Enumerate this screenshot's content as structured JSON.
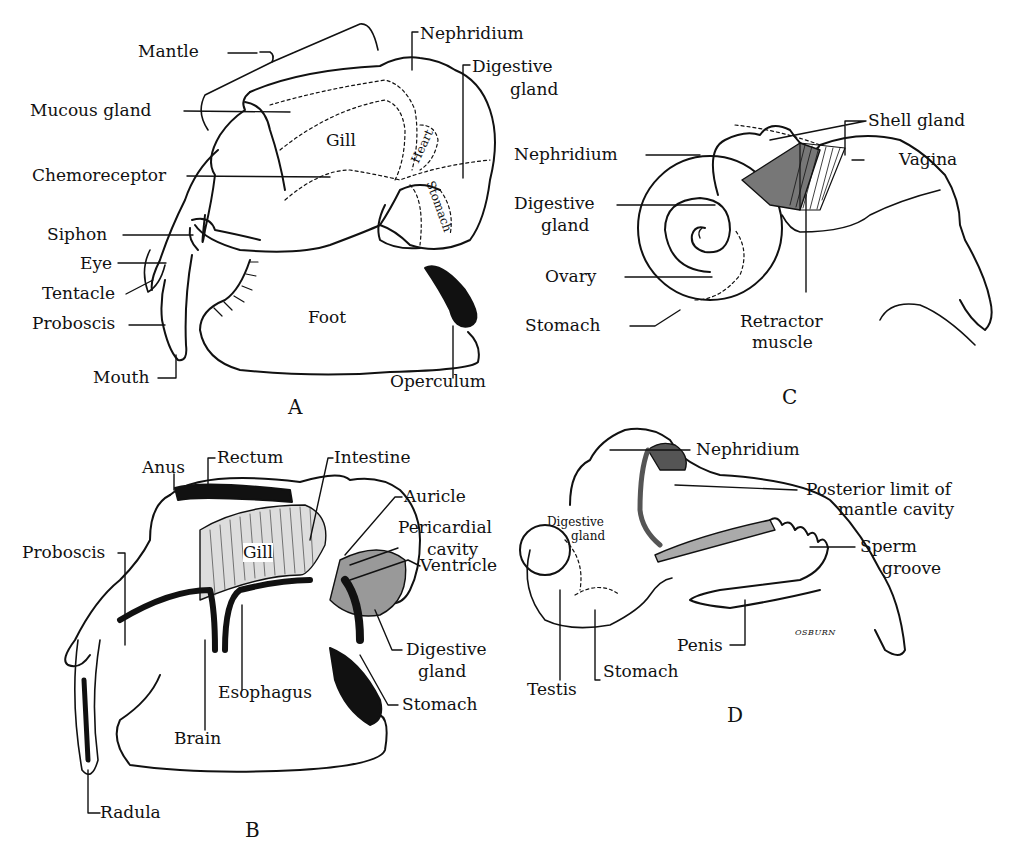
{
  "figure": {
    "panels": [
      {
        "letter": "A",
        "labels": {
          "mantle": "Mantle",
          "mucous_gland": "Mucous gland",
          "chemoreceptor": "Chemoreceptor",
          "siphon": "Siphon",
          "eye": "Eye",
          "tentacle": "Tentacle",
          "proboscis": "Proboscis",
          "mouth": "Mouth",
          "gill": "Gill",
          "nephridium": "Nephridium",
          "digestive_gland_1": "Digestive",
          "digestive_gland_2": "gland",
          "heart": "Heart",
          "stomach": "Stomach",
          "foot": "Foot",
          "operculum": "Operculum"
        }
      },
      {
        "letter": "B",
        "labels": {
          "anus": "Anus",
          "rectum": "Rectum",
          "intestine": "Intestine",
          "auricle": "Auricle",
          "pericardial_1": "Pericardial",
          "pericardial_2": "cavity",
          "ventricle": "Ventricle",
          "digestive_gland_1": "Digestive",
          "digestive_gland_2": "gland",
          "stomach": "Stomach",
          "esophagus": "Esophagus",
          "brain": "Brain",
          "proboscis": "Proboscis",
          "radula": "Radula",
          "gill": "Gill"
        }
      },
      {
        "letter": "C",
        "labels": {
          "nephridium": "Nephridium",
          "digestive_gland_1": "Digestive",
          "digestive_gland_2": "gland",
          "ovary": "Ovary",
          "stomach": "Stomach",
          "shell_gland": "Shell gland",
          "vagina": "Vagina",
          "retractor_1": "Retractor",
          "retractor_2": "muscle"
        }
      },
      {
        "letter": "D",
        "labels": {
          "nephridium": "Nephridium",
          "posterior_1": "Posterior limit of",
          "posterior_2": "mantle cavity",
          "sperm_groove_1": "Sperm",
          "sperm_groove_2": "groove",
          "penis": "Penis",
          "digestive_gland_1": "Digestive",
          "digestive_gland_2": "gland",
          "testis": "Testis",
          "stomach": "Stomach",
          "signature": "OSBURN"
        }
      }
    ]
  }
}
